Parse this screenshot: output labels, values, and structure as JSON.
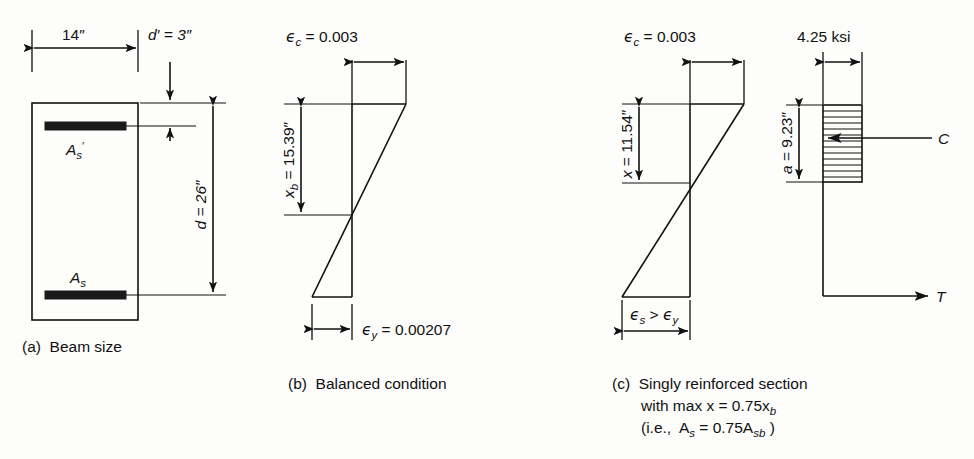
{
  "figure": {
    "background_color": "#fdfdfb",
    "ink_color": "#111111"
  },
  "panel_a": {
    "caption": "(a)  Beam size",
    "width_label": "14″",
    "cover_label": "d′ = 3″",
    "depth_label": "d = 26″",
    "top_steel_label": "A",
    "top_steel_sub": "s",
    "top_steel_prime": "′",
    "bottom_steel_label": "A",
    "bottom_steel_sub": "s",
    "values": {
      "width_in": 14,
      "cover_in": 3,
      "effective_depth_in": 26
    }
  },
  "panel_b": {
    "caption": "(b)  Balanced condition",
    "top_strain_symbol": "ϵ",
    "top_strain_sub": "c",
    "top_strain_text": "= 0.003",
    "top_strain_value": 0.003,
    "neutral_axis_label_sym": "x",
    "neutral_axis_label_sub": "b",
    "neutral_axis_label_text": "= 15.39″",
    "neutral_axis_value_in": 15.39,
    "bottom_strain_symbol": "ϵ",
    "bottom_strain_sub": "y",
    "bottom_strain_text": "= 0.00207",
    "bottom_strain_value": 0.00207
  },
  "panel_c": {
    "caption_line1": "(c)  Singly reinforced section",
    "caption_line2": "with max x = 0.75x",
    "caption_line2_sub": "b",
    "caption_line3_pre": "(i.e.,  A",
    "caption_line3_sub1": "s",
    "caption_line3_mid": " = 0.75A",
    "caption_line3_sub2": "sb",
    "caption_line3_post": " )",
    "top_strain_symbol": "ϵ",
    "top_strain_sub": "c",
    "top_strain_text": "= 0.003",
    "top_strain_value": 0.003,
    "neutral_axis_label_sym": "x",
    "neutral_axis_label_text": "= 11.54″",
    "neutral_axis_value_in": 11.54,
    "steel_strain_sym1": "ϵ",
    "steel_strain_sub1": "s",
    "steel_strain_gt": ">",
    "steel_strain_sym2": "ϵ",
    "steel_strain_sub2": "y"
  },
  "panel_d": {
    "stress_label": "4.25 ksi",
    "stress_value_ksi": 4.25,
    "depth_label_sym": "a",
    "depth_label_text": "= 9.23″",
    "depth_value_in": 9.23,
    "compression_force_label": "C",
    "tension_force_label": "T"
  }
}
